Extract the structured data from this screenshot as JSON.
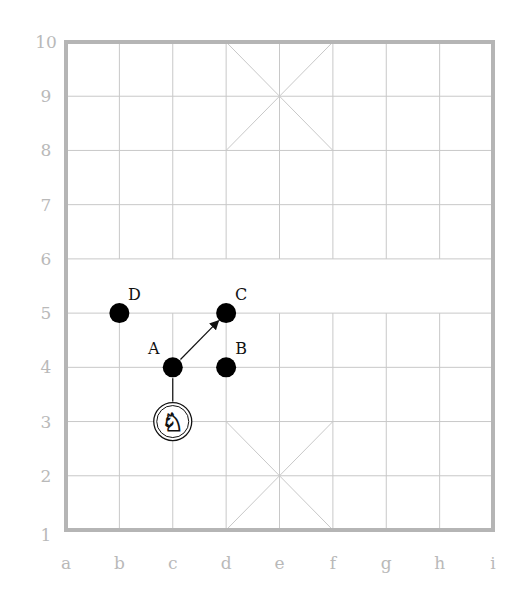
{
  "diagram": {
    "type": "xiangqi-board",
    "files": [
      "a",
      "b",
      "c",
      "d",
      "e",
      "f",
      "g",
      "h",
      "i"
    ],
    "ranks": [
      "1",
      "2",
      "3",
      "4",
      "5",
      "6",
      "7",
      "8",
      "9",
      "10"
    ],
    "river_between_ranks": [
      "5",
      "6"
    ],
    "palaces": [
      {
        "name": "bottom-palace",
        "from": "d1",
        "to": "f3",
        "center": "e2"
      },
      {
        "name": "top-palace",
        "from": "d8",
        "to": "f10",
        "center": "e9"
      }
    ],
    "pieces": [
      {
        "name": "horse",
        "glyph": "♞",
        "square": "c3"
      }
    ],
    "points": [
      {
        "label": "A",
        "square": "c4",
        "label_pos": "upper-left"
      },
      {
        "label": "B",
        "square": "d4",
        "label_pos": "upper-right"
      },
      {
        "label": "C",
        "square": "d5",
        "label_pos": "upper-right"
      },
      {
        "label": "D",
        "square": "b5",
        "label_pos": "upper-right"
      }
    ],
    "connectors": [
      {
        "from": "c3",
        "to": "c4",
        "style": "line"
      },
      {
        "from": "c4",
        "to": "d5",
        "style": "arrow"
      }
    ],
    "colors": {
      "grid": "#c8c8c8",
      "border": "#b5b5b5",
      "axis_text": "#b9b9b9",
      "piece": "#000000",
      "label": "#111111"
    }
  }
}
